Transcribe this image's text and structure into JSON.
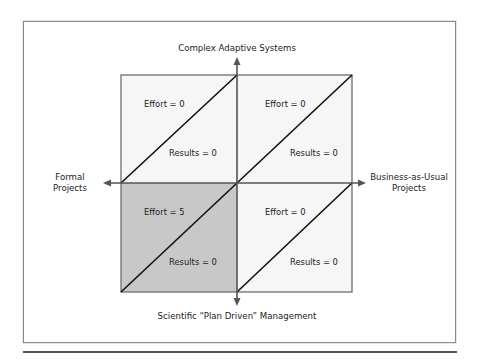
{
  "diagram": {
    "axes": {
      "top": "Complex Adaptive Systems",
      "bottom": "Scientific “Plan Driven” Management",
      "left_line1": "Formal",
      "left_line2": "Projects",
      "right_line1": "Business-as-Usual",
      "right_line2": "Projects"
    },
    "quadrants": {
      "top_left": {
        "effort": "Effort = 0",
        "results": "Results = 0",
        "shaded": false
      },
      "top_right": {
        "effort": "Effort = 0",
        "results": "Results = 0",
        "shaded": false
      },
      "bottom_left": {
        "effort": "Effort = 5",
        "results": "Results = 0",
        "shaded": true
      },
      "bottom_right": {
        "effort": "Effort = 0",
        "results": "Results = 0",
        "shaded": false
      }
    },
    "colors": {
      "light_fill": "#f6f6f6",
      "shaded_fill": "#c8c8c8",
      "line": "#111111",
      "box_border": "#6e6e6e",
      "axis": "#555555"
    }
  }
}
